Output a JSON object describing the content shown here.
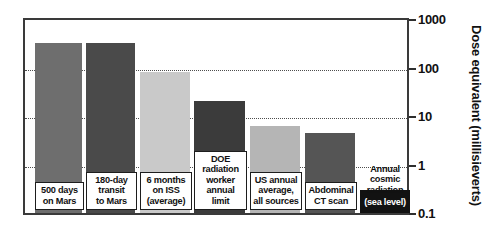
{
  "chart_data": {
    "type": "bar",
    "title": "",
    "xlabel": "",
    "ylabel": "Dose equivalent (millisieverts)",
    "yscale": "log",
    "ylim": [
      0.1,
      1000
    ],
    "ytick_labels": [
      "1000",
      "100",
      "10",
      "1",
      "0.1"
    ],
    "ytick_values": [
      1000,
      100,
      10,
      1,
      0.1
    ],
    "grid": true,
    "legend": "none",
    "categories": [
      "500 days on Mars",
      "180-day transit to Mars",
      "6 months on ISS (average)",
      "DOE radiation worker annual limit",
      "US annual average, all sources",
      "Abdominal CT scan",
      "Annual cosmic radiation (sea level)"
    ],
    "values": [
      320,
      320,
      80,
      20,
      6.2,
      4.5,
      0.3
    ],
    "bars": [
      {
        "label_lines": [
          "500 days",
          "on Mars"
        ],
        "value": 320,
        "color": "#6e6e6e",
        "label_style": "onwhite"
      },
      {
        "label_lines": [
          "180-day",
          "transit",
          "to Mars"
        ],
        "value": 320,
        "color": "#4a4a4a",
        "label_style": "onwhite"
      },
      {
        "label_lines": [
          "6 months",
          "on ISS",
          "(average)"
        ],
        "value": 80,
        "color": "#c9c9c9",
        "label_style": "onwhite"
      },
      {
        "label_lines": [
          "DOE",
          "radiation",
          "worker",
          "annual",
          "limit"
        ],
        "value": 20,
        "color": "#3b3b3b",
        "label_style": "onwhite"
      },
      {
        "label_lines": [
          "US annual",
          "average,",
          "all sources"
        ],
        "value": 6.2,
        "color": "#b5b5b5",
        "label_style": "onwhite"
      },
      {
        "label_lines": [
          "Abdominal",
          "CT scan"
        ],
        "value": 4.5,
        "color": "#555555",
        "label_style": "onwhite"
      },
      {
        "label_lines": [
          "Annual",
          "cosmic",
          "radiation"
        ],
        "value": 0.3,
        "color": "#121212",
        "label_style": "outside",
        "inverse_line": "(sea level)"
      }
    ]
  },
  "colors": {
    "axis": "#2e2e2e",
    "grid": "#4d4d4d",
    "background": "#ffffff",
    "text": "#111111"
  }
}
